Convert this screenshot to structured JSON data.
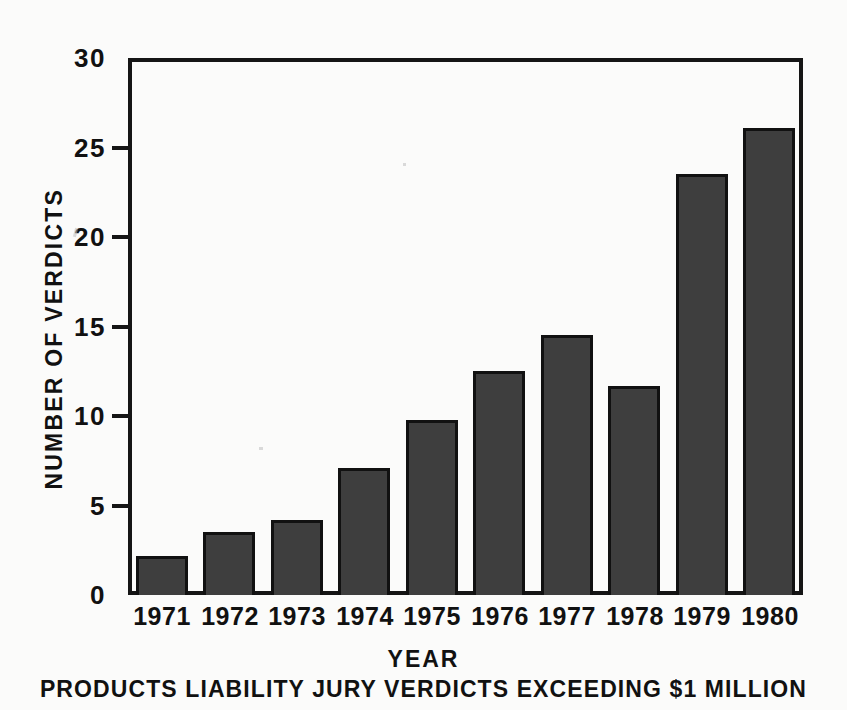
{
  "chart_data": {
    "type": "bar",
    "title": "",
    "caption": "PRODUCTS LIABILITY JURY VERDICTS EXCEEDING $1 MILLION",
    "xlabel": "YEAR",
    "ylabel": "NUMBER OF VERDICTS",
    "categories": [
      "1971",
      "1972",
      "1973",
      "1974",
      "1975",
      "1976",
      "1977",
      "1978",
      "1979",
      "1980"
    ],
    "values": [
      2.2,
      3.5,
      4.2,
      7.1,
      9.8,
      12.5,
      14.5,
      11.7,
      23.5,
      26.1
    ],
    "ylim": [
      0,
      30
    ],
    "yticks": [
      0,
      5,
      10,
      15,
      20,
      25,
      30
    ],
    "ytick_labels": [
      "0",
      "5",
      "10",
      "15",
      "20",
      "25",
      "30"
    ],
    "xlim_categories": 10,
    "grid": false,
    "legend": null,
    "legend_position": "none",
    "bar_color": "#3e3e3e",
    "bar_edge_color": "#111111",
    "axis_color": "#151515",
    "background_color": "#fbfbfa",
    "frame": "box"
  }
}
